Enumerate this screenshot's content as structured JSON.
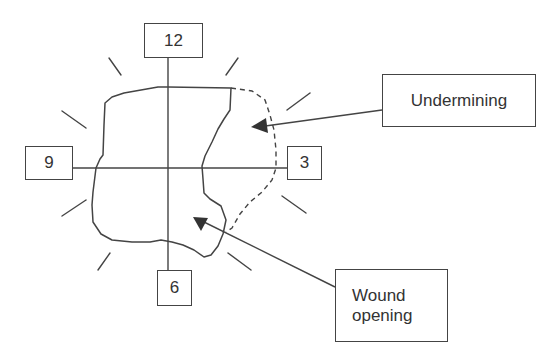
{
  "diagram": {
    "clock_labels": {
      "top": "12",
      "right": "3",
      "bottom": "6",
      "left": "9"
    },
    "callouts": {
      "undermining": "Undermining",
      "wound_opening": "Wound opening"
    },
    "colors": {
      "line": "#444444",
      "text": "#333333",
      "background": "#ffffff"
    }
  }
}
